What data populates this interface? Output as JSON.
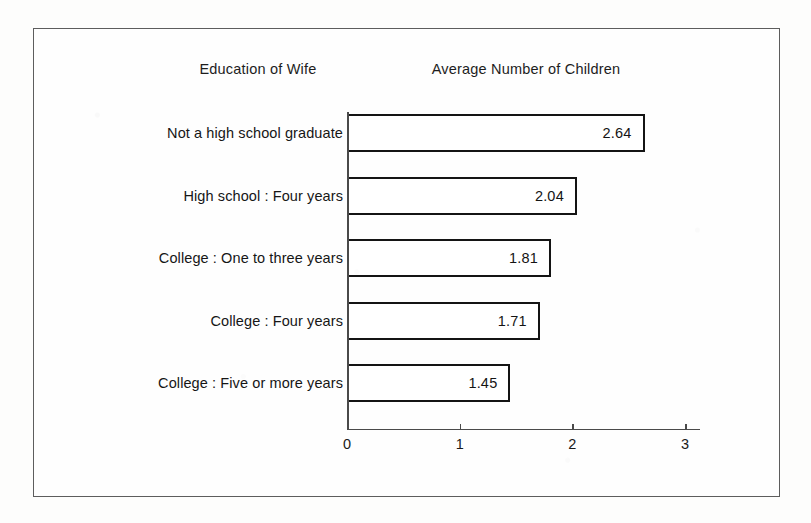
{
  "headers": {
    "category_title": "Education of Wife",
    "value_title": "Average Number of Children"
  },
  "chart_data": {
    "type": "bar",
    "orientation": "horizontal",
    "title": "",
    "subtitle": "",
    "xlabel": "Average Number of Children",
    "ylabel": "Education of Wife",
    "categories": [
      "Not a high school graduate",
      "High school : Four years",
      "College : One to three years",
      "College : Four years",
      "College : Five or more years"
    ],
    "values": [
      2.64,
      2.04,
      1.81,
      1.71,
      1.45
    ],
    "value_labels": [
      "2.64",
      "2.04",
      "1.81",
      "1.71",
      "1.45"
    ],
    "xlim": [
      0,
      3
    ],
    "xticks": [
      0,
      1,
      2,
      3
    ],
    "xtick_labels": [
      "0",
      "1",
      "2",
      "3"
    ],
    "grid": false,
    "legend": null,
    "bar_fill": "#ffffff",
    "bar_edge": "#141414",
    "axis_color": "#4a4a4a",
    "frame_color": "#5d5d5d",
    "background": "#fdfdfc"
  }
}
